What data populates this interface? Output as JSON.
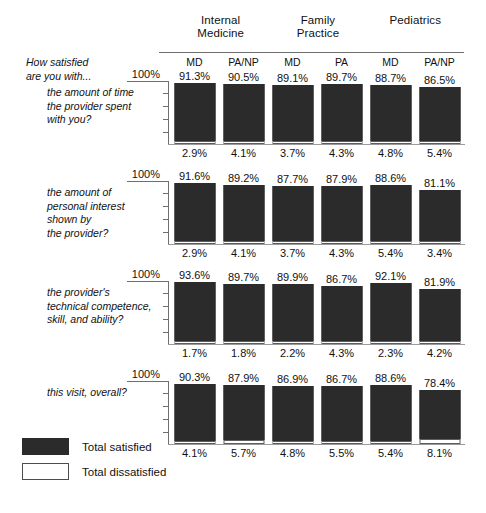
{
  "intro": {
    "line1": "How satisfied",
    "line2": "are you with..."
  },
  "legend": {
    "satisfied_label": "Total satisfied",
    "dissatisfied_label": "Total dissatisfied",
    "satisfied_color": "#2b2b2b",
    "dissatisfied_color": "#ffffff"
  },
  "axis_cap_label": "100%",
  "chart_data": {
    "type": "bar",
    "title": "How satisfied are you with...",
    "xlabel": "",
    "ylabel": "",
    "ylim": [
      0,
      100
    ],
    "grid": false,
    "legend_position": "bottom-left",
    "group_headers": [
      {
        "line1": "Internal",
        "line2": "Medicine"
      },
      {
        "line1": "Family",
        "line2": "Practice"
      },
      {
        "line1": "Pediatrics",
        "line2": ""
      }
    ],
    "categories": [
      "MD",
      "PA/NP",
      "MD",
      "PA",
      "MD",
      "PA/NP"
    ],
    "series": [
      {
        "name": "Total satisfied",
        "color": "#2b2b2b"
      },
      {
        "name": "Total dissatisfied",
        "color": "#ffffff"
      }
    ],
    "panels": [
      {
        "label": [
          "the amount of time",
          "the provider spent",
          "with you?"
        ],
        "axis_cap": "100%",
        "satisfied": [
          91.3,
          90.5,
          89.1,
          89.7,
          88.7,
          86.5
        ],
        "dissatisfied": [
          2.9,
          4.1,
          3.7,
          4.3,
          4.8,
          5.4
        ],
        "satisfied_labels": [
          "91.3%",
          "90.5%",
          "89.1%",
          "89.7%",
          "88.7%",
          "86.5%"
        ],
        "dissatisfied_labels": [
          "2.9%",
          "4.1%",
          "3.7%",
          "4.3%",
          "4.8%",
          "5.4%"
        ]
      },
      {
        "label": [
          "the amount of",
          "personal interest",
          "shown by",
          "the provider?"
        ],
        "axis_cap": "100%",
        "satisfied": [
          91.6,
          89.2,
          87.7,
          87.9,
          88.6,
          81.1
        ],
        "dissatisfied": [
          2.9,
          4.1,
          3.7,
          4.3,
          5.4,
          3.4
        ],
        "satisfied_labels": [
          "91.6%",
          "89.2%",
          "87.7%",
          "87.9%",
          "88.6%",
          "81.1%"
        ],
        "dissatisfied_labels": [
          "2.9%",
          "4.1%",
          "3.7%",
          "4.3%",
          "5.4%",
          "3.4%"
        ]
      },
      {
        "label": [
          "the provider's",
          "technical competence,",
          "skill, and ability?"
        ],
        "axis_cap": "100%",
        "satisfied": [
          93.6,
          89.7,
          89.9,
          86.7,
          92.1,
          81.9
        ],
        "dissatisfied": [
          1.7,
          1.8,
          2.2,
          4.3,
          2.3,
          4.2
        ],
        "satisfied_labels": [
          "93.6%",
          "89.7%",
          "89.9%",
          "86.7%",
          "92.1%",
          "81.9%"
        ],
        "dissatisfied_labels": [
          "1.7%",
          "1.8%",
          "2.2%",
          "4.3%",
          "2.3%",
          "4.2%"
        ]
      },
      {
        "label": [
          "this visit, overall?"
        ],
        "axis_cap": "100%",
        "satisfied": [
          90.3,
          87.9,
          86.9,
          86.7,
          88.6,
          78.4
        ],
        "dissatisfied": [
          4.1,
          5.7,
          4.8,
          5.5,
          5.4,
          8.1
        ],
        "satisfied_labels": [
          "90.3%",
          "87.9%",
          "86.9%",
          "86.7%",
          "88.6%",
          "78.4%"
        ],
        "dissatisfied_labels": [
          "4.1%",
          "5.7%",
          "4.8%",
          "5.5%",
          "5.4%",
          "8.1%"
        ]
      }
    ]
  }
}
